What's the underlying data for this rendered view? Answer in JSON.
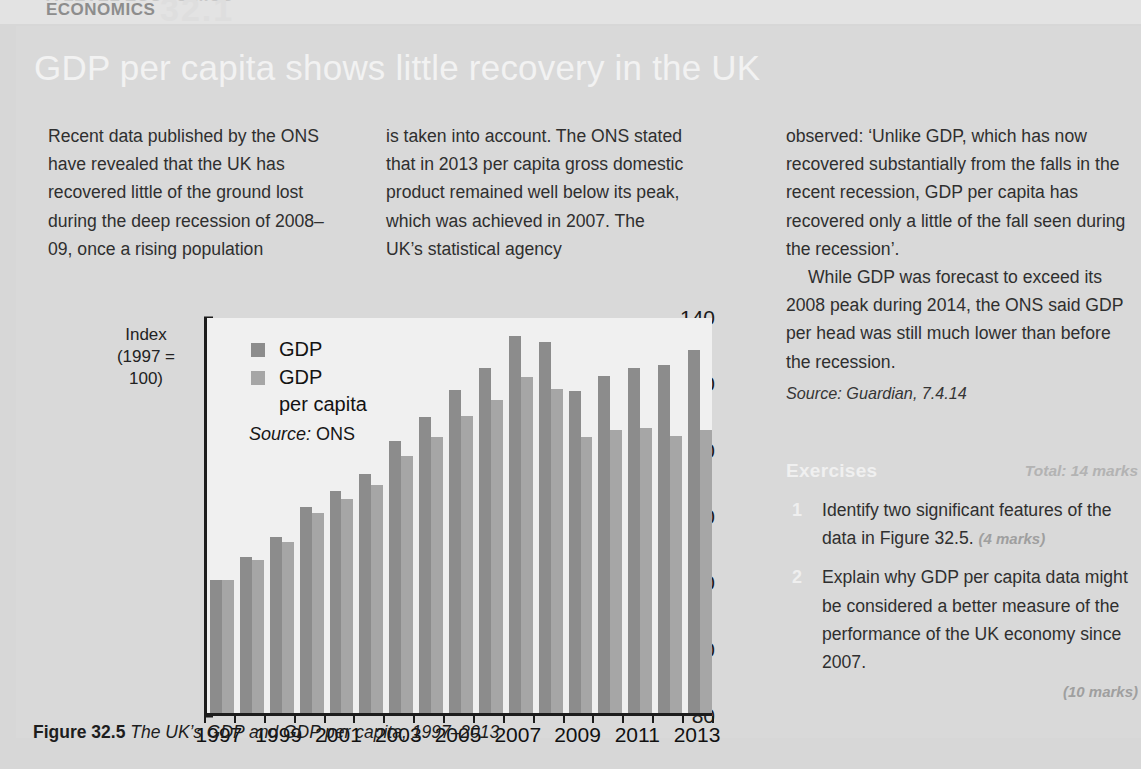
{
  "runhead": {
    "ghost_line": "A LEVEL ECONOMICS",
    "subject": "ECONOMICS",
    "chapter_number": "32.1"
  },
  "article": {
    "headline": "GDP per capita shows little recovery in the UK",
    "column1": [
      "Recent data published by the ONS have revealed that the UK has recovered little of the ground lost during the deep recession of 2008–09, once a rising population"
    ],
    "column2": [
      "is taken into account. The ONS stated that in 2013 per capita gross domestic product remained well below its peak, which was achieved in 2007. The UK’s statistical agency"
    ],
    "column3": [
      "observed: ‘Unlike GDP, which has now recovered substantially from the falls in the recent recession, GDP per capita has recovered only a little of the fall seen during the recession’.",
      "While GDP was forecast to exceed its 2008 peak during 2014, the ONS said GDP per head was still much lower than before the recession."
    ],
    "column3_source": "Source: Guardian, 7.4.14"
  },
  "exercises": {
    "title": "Exercises",
    "total": "Total: 14 marks",
    "items": [
      {
        "number": "1",
        "text": "Identify two significant features of the data in Figure 32.5.",
        "marks": "(4 marks)"
      },
      {
        "number": "2",
        "text": "Explain why GDP per capita data might be considered a better measure of the performance of the UK economy since 2007.",
        "marks": "(10 marks)"
      }
    ]
  },
  "figure": {
    "caption_label": "Figure 32.5",
    "caption_text": "The UK’s GDP and GDP per capita, 1997–2013"
  },
  "chart_data": {
    "type": "bar",
    "title": "",
    "ylabel_line1": "Index",
    "ylabel_line2": "(1997 = 100)",
    "xlabel": "",
    "ylim": [
      80,
      140
    ],
    "yticks": [
      80,
      90,
      100,
      110,
      120,
      130,
      140
    ],
    "xtick_labels": [
      "1997",
      "1999",
      "2001",
      "2003",
      "2005",
      "2007",
      "2009",
      "2011",
      "2013"
    ],
    "grid": false,
    "legend_position": "top-left",
    "source": "Source: ONS",
    "source_prefix": "Source:",
    "source_value": "ONS",
    "categories": [
      "1997",
      "1998",
      "1999",
      "2000",
      "2001",
      "2002",
      "2003",
      "2004",
      "2005",
      "2006",
      "2007",
      "2008",
      "2009",
      "2010",
      "2011",
      "2012",
      "2013"
    ],
    "series": [
      {
        "name": "GDP",
        "color": "#8c8c8c",
        "values": [
          100.0,
          103.5,
          106.5,
          111.0,
          113.5,
          116.0,
          121.0,
          124.6,
          128.7,
          132.0,
          136.8,
          135.9,
          128.6,
          130.8,
          132.0,
          132.4,
          134.7
        ]
      },
      {
        "name": "GDP per capita",
        "color": "#a6a6a6",
        "values": [
          100.0,
          103.0,
          105.8,
          110.2,
          112.2,
          114.4,
          118.7,
          121.6,
          124.8,
          127.2,
          130.7,
          128.8,
          121.6,
          122.6,
          122.9,
          121.7,
          122.7
        ]
      }
    ],
    "legend_entries": [
      "GDP",
      "GDP per capita"
    ],
    "legend_entry_2_line1": "GDP",
    "legend_entry_2_line2": "per capita"
  }
}
